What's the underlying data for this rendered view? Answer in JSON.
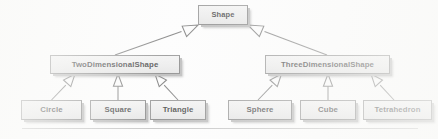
{
  "diagram": {
    "kind": "uml-class-hierarchy",
    "background_color": "#fcfcfc",
    "box_fill_color": "#e8e8e8",
    "box_border_color": "#7a7a7a",
    "box_shadow_color": "#a8a8a8",
    "line_color": "#5f5f5f",
    "relationship_type": "generalization",
    "arrowhead": "hollow-triangle",
    "nodes": {
      "root": {
        "label": "Shape",
        "level": 0
      },
      "left_branch": {
        "label": "TwoDimensionalShape",
        "level": 1
      },
      "right_branch": {
        "label": "ThreeDimensionalShape",
        "level": 1
      },
      "leaves": [
        {
          "label": "Circle",
          "parent": "TwoDimensionalShape"
        },
        {
          "label": "Square",
          "parent": "TwoDimensionalShape"
        },
        {
          "label": "Triangle",
          "parent": "TwoDimensionalShape"
        },
        {
          "label": "Sphere",
          "parent": "ThreeDimensionalShape"
        },
        {
          "label": "Cube",
          "parent": "ThreeDimensionalShape"
        },
        {
          "label": "Tetrahedron",
          "parent": "ThreeDimensionalShape"
        }
      ]
    },
    "footer_rule": {
      "visible": true
    }
  }
}
